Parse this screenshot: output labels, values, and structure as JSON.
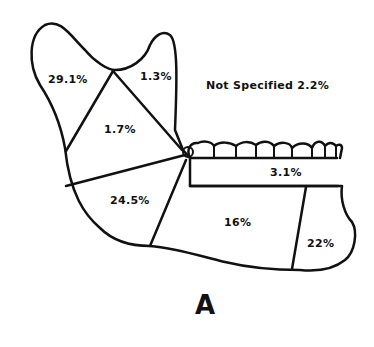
{
  "figure": {
    "panel_label": "A",
    "regions": [
      {
        "name": "condyle",
        "value": "29.1%"
      },
      {
        "name": "coronoid",
        "value": "1.3%"
      },
      {
        "name": "ramus",
        "value": "1.7%"
      },
      {
        "name": "angle",
        "value": "24.5%"
      },
      {
        "name": "body",
        "value": "16%"
      },
      {
        "name": "alveolar",
        "value": "3.1%"
      },
      {
        "name": "symphysis",
        "value": "22%"
      }
    ],
    "not_specified": "Not Specified 2.2%"
  }
}
